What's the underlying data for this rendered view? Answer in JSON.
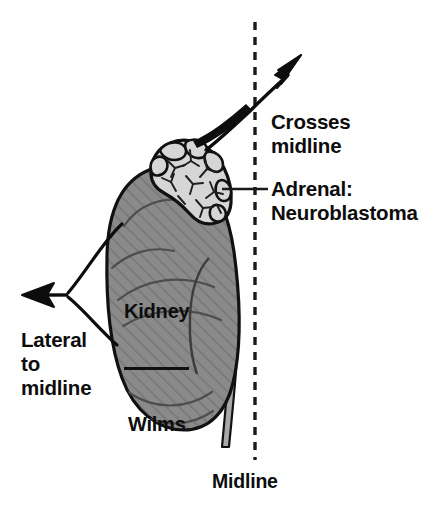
{
  "figure": {
    "width": 440,
    "height": 511,
    "background_color": "#ffffff"
  },
  "labels": {
    "crosses_midline": "Crosses\nmidline",
    "adrenal_neuroblastoma": "Adrenal:\nNeuroblastoma",
    "lateral_to_midline": "Lateral\nto\nmidline",
    "midline": "Midline",
    "kidney": "Kidney",
    "wilms": "Wilms"
  },
  "anatomy": {
    "kidney": {
      "name": "kidney",
      "fill_color": "#8a8a8a",
      "hatch_color": "#6e6e6e",
      "outline_color": "#111111"
    },
    "adrenal": {
      "name": "adrenal-gland-mass",
      "fill_color": "#d6d6d6",
      "detail_color": "#1a1a1a",
      "outline_color": "#111111"
    },
    "ureter": {
      "name": "ureter",
      "fill_color": "#a8a8a8",
      "outline_color": "#111111"
    }
  },
  "markers": {
    "midline": {
      "name": "midline-dashed-axis",
      "color": "#1a1a1a",
      "style": "dashed",
      "x": 255
    },
    "arrow_crosses": {
      "name": "crosses-midline-arrow",
      "color": "#0d0d0d",
      "direction": "up-right"
    },
    "arrow_lateral": {
      "name": "lateral-to-midline-arrow",
      "color": "#0d0d0d",
      "direction": "left"
    },
    "leader_adrenal": {
      "name": "adrenal-leader-line",
      "color": "#1a1a1a"
    }
  }
}
